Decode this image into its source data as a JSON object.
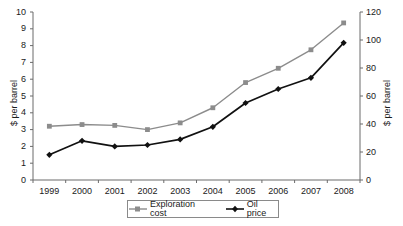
{
  "chart_data": {
    "type": "line",
    "title": "",
    "xlabel": "",
    "categories": [
      "1999",
      "2000",
      "2001",
      "2002",
      "2003",
      "2004",
      "2005",
      "2006",
      "2007",
      "2008"
    ],
    "grid": false,
    "legend_position": "bottom",
    "axes": {
      "left": {
        "label": "$ per barrel",
        "ylim": [
          0,
          10
        ],
        "ticks": [
          0,
          1,
          2,
          3,
          4,
          5,
          6,
          7,
          8,
          9,
          10
        ],
        "tick_labels": [
          "0",
          "1",
          "2",
          "3",
          "4",
          "5",
          "6",
          "7",
          "8",
          "9",
          "10"
        ]
      },
      "right": {
        "label": "$ per barrel",
        "ylim": [
          0,
          120
        ],
        "ticks": [
          0,
          20,
          40,
          60,
          80,
          100,
          120
        ],
        "tick_labels": [
          "0",
          "20",
          "40",
          "60",
          "80",
          "100",
          "120"
        ]
      }
    },
    "series": [
      {
        "name": "Exploration cost",
        "axis": "left",
        "color": "#8c8c8c",
        "marker": "square",
        "values": [
          3.2,
          3.3,
          3.25,
          3.0,
          3.4,
          4.3,
          5.8,
          6.65,
          7.75,
          9.35
        ]
      },
      {
        "name": "Oil price",
        "axis": "right",
        "color": "#111111",
        "marker": "diamond",
        "values": [
          18,
          28,
          24,
          25,
          29,
          38,
          55,
          65,
          73,
          98
        ]
      }
    ]
  },
  "legend": {
    "items": [
      {
        "label": "Exploration cost"
      },
      {
        "label": "Oil price"
      }
    ]
  }
}
